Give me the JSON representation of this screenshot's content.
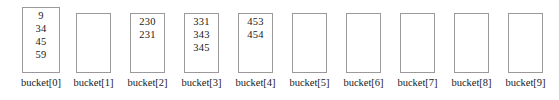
{
  "figure": {
    "box_border_color": "#9a9a9a",
    "background_color": "#ffffff",
    "text_color": "#1a1a1a"
  },
  "buckets": [
    {
      "label": "bucket[0]",
      "values": [
        "9",
        "34",
        "45",
        "59"
      ],
      "box_left": 22,
      "box_top": 7,
      "box_width": 38,
      "box_height": 66
    },
    {
      "label": "bucket[1]",
      "values": [],
      "box_left": 76,
      "box_top": 13,
      "box_width": 35,
      "box_height": 60
    },
    {
      "label": "bucket[2]",
      "values": [
        "230",
        "231"
      ],
      "box_left": 130,
      "box_top": 13,
      "box_width": 35,
      "box_height": 60
    },
    {
      "label": "bucket[3]",
      "values": [
        "331",
        "343",
        "345"
      ],
      "box_left": 184,
      "box_top": 13,
      "box_width": 35,
      "box_height": 60
    },
    {
      "label": "bucket[4]",
      "values": [
        "453",
        "454"
      ],
      "box_left": 238,
      "box_top": 13,
      "box_width": 35,
      "box_height": 60
    },
    {
      "label": "bucket[5]",
      "values": [],
      "box_left": 292,
      "box_top": 13,
      "box_width": 35,
      "box_height": 60
    },
    {
      "label": "bucket[6]",
      "values": [],
      "box_left": 346,
      "box_top": 13,
      "box_width": 35,
      "box_height": 60
    },
    {
      "label": "bucket[7]",
      "values": [],
      "box_left": 400,
      "box_top": 13,
      "box_width": 35,
      "box_height": 60
    },
    {
      "label": "bucket[8]",
      "values": [],
      "box_left": 454,
      "box_top": 13,
      "box_width": 35,
      "box_height": 60
    },
    {
      "label": "bucket[9]",
      "values": [],
      "box_left": 508,
      "box_top": 13,
      "box_width": 35,
      "box_height": 60
    }
  ]
}
